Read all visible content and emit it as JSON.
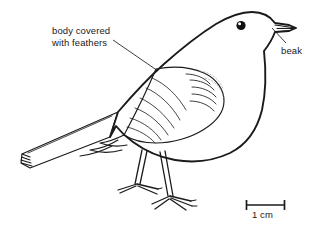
{
  "figure": {
    "type": "labelled-biology-diagram",
    "background_color": "#ffffff",
    "ink_color": "#1a1a1a",
    "faint_ink_color": "#9a9a9a"
  },
  "labels": {
    "feathers": {
      "line1": "body covered",
      "line2": "with feathers"
    },
    "beak": "beak"
  },
  "scale_bar": {
    "caption": "1 cm",
    "length_px": 40
  }
}
